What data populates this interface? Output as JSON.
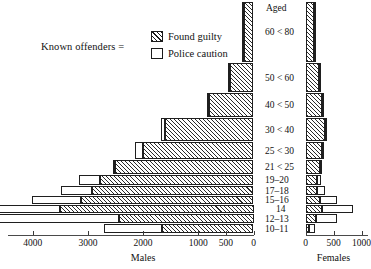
{
  "legend": {
    "title": "Known offenders =",
    "items": [
      {
        "label": "Found guilty",
        "pattern": "hatched"
      },
      {
        "label": "Police caution",
        "pattern": "open"
      }
    ]
  },
  "axes": {
    "center_header": "Aged",
    "males": {
      "title": "Males",
      "ticks": [
        "4000",
        "3000",
        "2000",
        "1000",
        "500",
        "0"
      ],
      "tick_values": [
        4000,
        3000,
        2000,
        1000,
        500,
        0
      ],
      "max": 4400
    },
    "females": {
      "title": "Females",
      "ticks": [
        "0",
        "500",
        "1000"
      ],
      "tick_values": [
        0,
        500,
        1000
      ],
      "max": 1150
    }
  },
  "chart_data": {
    "type": "bar",
    "subtype": "population-pyramid",
    "title": "",
    "xlabel": "",
    "ylabel": "Aged",
    "orientation": "horizontal",
    "grid": false,
    "legend_position": "top-left",
    "categories": [
      "60 < 80",
      "50 < 60",
      "40 < 50",
      "30 < 40",
      "25 < 30",
      "21 < 25",
      "19–20",
      "17–18",
      "15–16",
      "14",
      "12–13",
      "10–11"
    ],
    "series": [
      {
        "name": "Males - Found guilty",
        "side": "left",
        "values": [
          200,
          430,
          800,
          1600,
          2000,
          2520,
          2780,
          2920,
          3120,
          3500,
          2440,
          1660
        ]
      },
      {
        "name": "Males - Police caution",
        "side": "left",
        "values": [
          15,
          25,
          40,
          80,
          150,
          30,
          390,
          560,
          900,
          4330,
          2440,
          1050
        ]
      },
      {
        "name": "Females - Found guilty",
        "side": "right",
        "values": [
          170,
          250,
          300,
          340,
          290,
          260,
          200,
          210,
          250,
          290,
          190,
          60
        ]
      },
      {
        "name": "Females - Police caution",
        "side": "right",
        "values": [
          10,
          20,
          30,
          40,
          40,
          40,
          70,
          130,
          320,
          560,
          380,
          110
        ]
      }
    ],
    "males_xlim": [
      0,
      4400
    ],
    "females_xlim": [
      0,
      1150
    ],
    "note": "Males axis decreases left-to-right (4000 to 0); females axis increases left-to-right (0 to 1000)"
  }
}
